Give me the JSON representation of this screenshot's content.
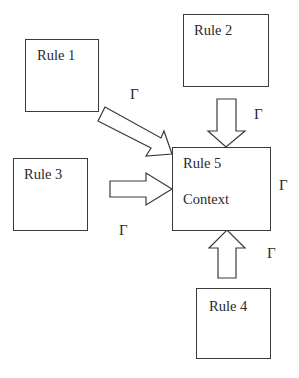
{
  "diagram": {
    "rules": [
      {
        "id": "rule1",
        "label": "Rule 1"
      },
      {
        "id": "rule2",
        "label": "Rule 2"
      },
      {
        "id": "rule3",
        "label": "Rule 3"
      },
      {
        "id": "rule4",
        "label": "Rule 4"
      },
      {
        "id": "rule5",
        "label": "Rule 5",
        "sublabel": "Context"
      }
    ],
    "edge_label": "Γ",
    "edges": [
      {
        "from": "rule1",
        "to": "rule5",
        "label": "Γ"
      },
      {
        "from": "rule2",
        "to": "rule5",
        "label": "Γ"
      },
      {
        "from": "rule3",
        "to": "rule5",
        "label": "Γ"
      },
      {
        "from": "rule4",
        "to": "rule5",
        "label": "Γ"
      }
    ],
    "context_label": "Γ"
  }
}
